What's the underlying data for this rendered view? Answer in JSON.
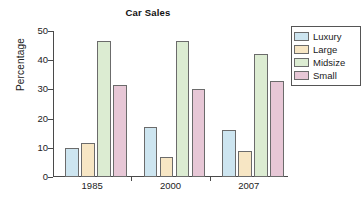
{
  "chart_data": {
    "type": "bar",
    "title": "Car Sales",
    "xlabel": "",
    "ylabel": "Percentage",
    "categories": [
      "1985",
      "2000",
      "2007"
    ],
    "ylim": [
      0,
      50
    ],
    "y_ticks": [
      0,
      10,
      20,
      30,
      40,
      50
    ],
    "grid": false,
    "legend_position": "right",
    "series": [
      {
        "name": "Luxury",
        "color": "#cde5f0",
        "values": [
          10,
          17,
          16
        ]
      },
      {
        "name": "Large",
        "color": "#f7e6c4",
        "values": [
          11.5,
          7,
          9
        ]
      },
      {
        "name": "Midsize",
        "color": "#dcecd2",
        "values": [
          46.5,
          46.5,
          42
        ]
      },
      {
        "name": "Small",
        "color": "#e7c7d6",
        "values": [
          31.5,
          30,
          33
        ]
      }
    ]
  },
  "axis": {
    "y_tick_labels": [
      "50",
      "40",
      "30",
      "20",
      "10",
      "0"
    ],
    "x_tick_labels": [
      "1985",
      "2000",
      "2007"
    ]
  }
}
